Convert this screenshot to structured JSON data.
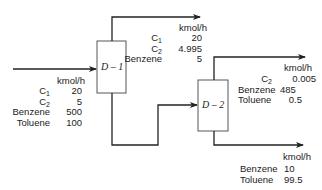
{
  "units": {
    "d1": {
      "label": "D – 1"
    },
    "d2": {
      "label": "D – 2"
    }
  },
  "flow_unit": "kmol/h",
  "streams": {
    "feed": {
      "unit_label": "kmol/h",
      "components": [
        {
          "name": "C",
          "sub": "1",
          "value": "20"
        },
        {
          "name": "C",
          "sub": "2",
          "value": "5"
        },
        {
          "name": "Benzene",
          "sub": "",
          "value": "500"
        },
        {
          "name": "Toluene",
          "sub": "",
          "value": "100"
        }
      ]
    },
    "d1_overhead": {
      "unit_label": "kmol/h",
      "components": [
        {
          "name": "C",
          "sub": "1",
          "value": "20"
        },
        {
          "name": "C",
          "sub": "2",
          "value": "4.995"
        },
        {
          "name": "Benzene",
          "sub": "",
          "value": "5"
        }
      ]
    },
    "d2_overhead": {
      "unit_label": "kmol/h",
      "components": [
        {
          "name": "C",
          "sub": "2",
          "value": "0.005"
        },
        {
          "name": "Benzene",
          "sub": "",
          "value": "485"
        },
        {
          "name": "Toluene",
          "sub": "",
          "value": "0.5"
        }
      ]
    },
    "d2_bottoms": {
      "unit_label": "kmol/h",
      "components": [
        {
          "name": "Benzene",
          "sub": "",
          "value": "10"
        },
        {
          "name": "Toluene",
          "sub": "",
          "value": "99.5"
        }
      ]
    }
  }
}
